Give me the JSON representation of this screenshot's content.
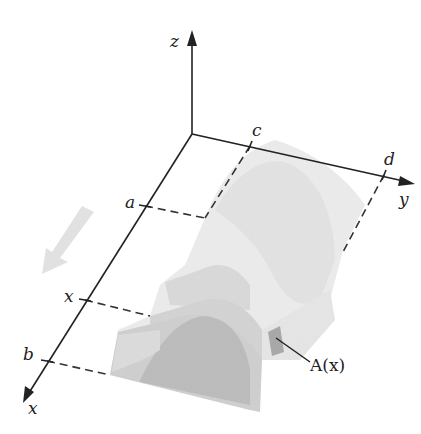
{
  "diagram": {
    "type": "3d-solid-cross-section",
    "axes": {
      "z_label": "z",
      "y_label": "y",
      "x_label": "x"
    },
    "x_axis_marks": {
      "a": "a",
      "x": "x",
      "b": "b"
    },
    "y_axis_marks": {
      "c": "c",
      "d": "d"
    },
    "cross_section_label": "A(x)",
    "colors": {
      "axis": "#222222",
      "solid_light": "#ececec",
      "solid_mid": "#d9d9d9",
      "solid_dark": "#bcbcbc",
      "cross_section": "#a8a8a8",
      "direction_arrow": "#dcdcdc"
    }
  }
}
